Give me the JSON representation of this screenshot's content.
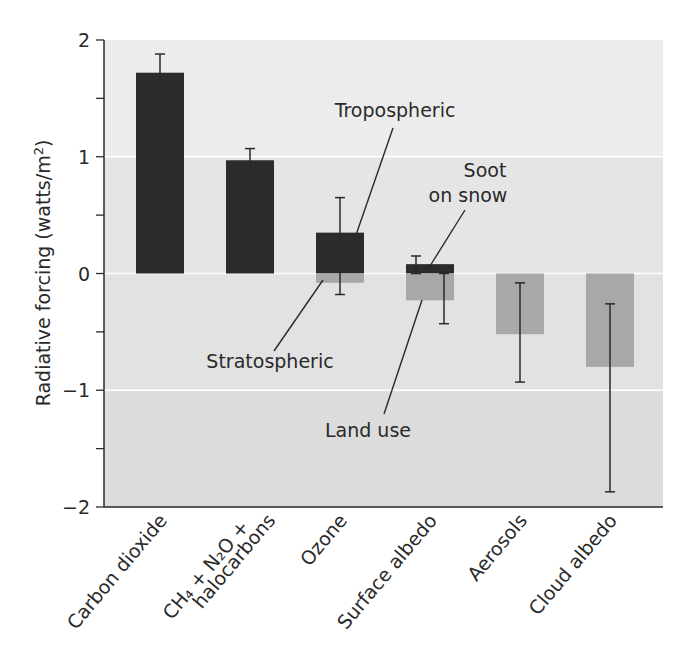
{
  "chart_data": {
    "type": "bar",
    "title": "",
    "xlabel": "",
    "ylabel": "Radiative forcing (watts/m²)",
    "ylabel_parts": {
      "main": "Radiative forcing (watts/m",
      "sup": "2",
      "end": ")"
    },
    "ylim": [
      -2,
      2
    ],
    "yticks": [
      2,
      1,
      0,
      -1,
      -2
    ],
    "ytick_labels": [
      "2",
      "1",
      "0",
      "−1",
      "−2"
    ],
    "grid": true,
    "legend": null,
    "categories": [
      "Carbon dioxide",
      "CH4 + N2O + halocarbons",
      "Ozone",
      "Surface albedo",
      "Aerosols",
      "Cloud albedo"
    ],
    "category_labels": [
      {
        "lines": [
          "Carbon dioxide"
        ]
      },
      {
        "lines": [
          "CH₄ + N₂O +",
          "halocarbons"
        ]
      },
      {
        "lines": [
          "Ozone"
        ]
      },
      {
        "lines": [
          "Surface albedo"
        ]
      },
      {
        "lines": [
          "Aerosols"
        ]
      },
      {
        "lines": [
          "Cloud albedo"
        ]
      }
    ],
    "bars": [
      {
        "category": "Carbon dioxide",
        "component": "",
        "value": 1.72,
        "error": [
          1.49,
          1.88
        ],
        "color": "#2b2b2b"
      },
      {
        "category": "CH4 + N2O + halocarbons",
        "component": "",
        "value": 0.97,
        "error": [
          0.85,
          1.07
        ],
        "color": "#2b2b2b"
      },
      {
        "category": "Ozone",
        "component": "Tropospheric",
        "value": 0.35,
        "error": [
          0.26,
          0.65
        ],
        "color": "#2b2b2b"
      },
      {
        "category": "Ozone",
        "component": "Stratospheric",
        "value": -0.08,
        "error": [
          -0.18,
          0.05
        ],
        "color": "#a8a8a8"
      },
      {
        "category": "Surface albedo",
        "component": "Soot on snow",
        "value": 0.08,
        "error": [
          0.0,
          0.15
        ],
        "color": "#2b2b2b"
      },
      {
        "category": "Surface albedo",
        "component": "Land use",
        "value": -0.23,
        "error": [
          -0.43,
          0.0
        ],
        "color": "#a8a8a8"
      },
      {
        "category": "Aerosols",
        "component": "",
        "value": -0.52,
        "error": [
          -0.93,
          -0.08
        ],
        "color": "#a8a8a8"
      },
      {
        "category": "Cloud albedo",
        "component": "",
        "value": -0.8,
        "error": [
          -1.87,
          -0.26
        ],
        "color": "#a8a8a8"
      }
    ],
    "annotations": [
      {
        "text": "Tropospheric",
        "target": "Ozone (positive)"
      },
      {
        "text": "Stratospheric",
        "target": "Ozone (negative)"
      },
      {
        "text": "Soot on snow",
        "target": "Surface albedo (positive)"
      },
      {
        "text": "Land use",
        "target": "Surface albedo (negative)"
      }
    ]
  },
  "colors": {
    "positive_bar": "#2b2b2b",
    "negative_bar": "#a8a8a8",
    "plot_background": "#e6e6e6",
    "gridline": "#ffffff",
    "axis": "#2a2a2a"
  }
}
